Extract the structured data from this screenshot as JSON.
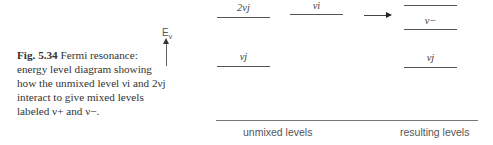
{
  "caption": {
    "fig_number": "Fig. 5.34",
    "text": "Fermi resonance: energy level diagram showing how the unmixed level νi and 2νj interact to give mixed levels labeled ν+ and ν−."
  },
  "axis": {
    "label": "E",
    "subscript": "v",
    "icon": "up-arrow-icon"
  },
  "unmixed_levels": [
    {
      "label": "2νj",
      "x": 217,
      "y": 17,
      "width": 53
    },
    {
      "label": "νi",
      "x": 290,
      "y": 14,
      "width": 53
    },
    {
      "label": "νj",
      "x": 217,
      "y": 66,
      "width": 53
    }
  ],
  "resulting_levels": [
    {
      "label": "ν+",
      "x": 404,
      "y": 5,
      "width": 53
    },
    {
      "label": "ν−",
      "x": 404,
      "y": 29,
      "width": 53
    },
    {
      "label": "νj",
      "x": 404,
      "y": 67,
      "width": 53
    }
  ],
  "transition_arrow": {
    "icon": "right-arrow-icon"
  },
  "footer": {
    "left": "unmixed levels",
    "right": "resulting levels"
  }
}
